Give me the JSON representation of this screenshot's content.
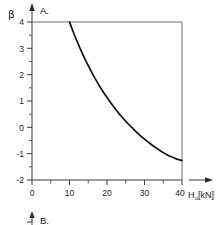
{
  "figure": {
    "panel_a_label": "A.",
    "panel_b_label": "B.",
    "y_axis_symbol": "β",
    "x_axis_title": "H",
    "x_axis_subscript": "o",
    "x_axis_unit": "[kN]"
  },
  "chart_data": {
    "type": "line",
    "title": "A.",
    "xlabel": "H₀ [kN]",
    "ylabel": "β",
    "xlim": [
      0,
      40
    ],
    "ylim": [
      -2,
      4
    ],
    "grid": false,
    "legend": "none",
    "x_ticks": [
      0,
      10,
      20,
      30,
      40
    ],
    "x_tick_labels": [
      "0",
      "10",
      "20",
      "30",
      "40"
    ],
    "x_minor_ticks": [
      5,
      15,
      25,
      35
    ],
    "y_ticks": [
      -2,
      -1,
      0,
      1,
      2,
      3,
      4
    ],
    "y_tick_labels": [
      "-2",
      "-1",
      "0",
      "1",
      "2",
      "3",
      "4"
    ],
    "y_minor_ticks": [
      -1.5,
      -0.5,
      0.5,
      1.5,
      2.5,
      3.5
    ],
    "series": [
      {
        "name": "beta-vs-H0",
        "x": [
          10,
          11,
          12,
          13,
          14,
          15,
          16,
          17,
          18,
          19,
          20,
          21,
          22,
          23,
          24,
          25,
          26,
          27,
          28,
          29,
          30,
          31,
          32,
          33,
          34,
          35,
          36,
          37,
          38,
          39,
          40
        ],
        "values": [
          4.0,
          3.62,
          3.27,
          2.94,
          2.63,
          2.34,
          2.07,
          1.81,
          1.57,
          1.34,
          1.13,
          0.93,
          0.74,
          0.56,
          0.39,
          0.23,
          0.08,
          -0.06,
          -0.2,
          -0.33,
          -0.45,
          -0.56,
          -0.67,
          -0.77,
          -0.87,
          -0.96,
          -1.04,
          -1.11,
          -1.17,
          -1.22,
          -1.26
        ]
      }
    ],
    "annotations": [
      {
        "text": "A.",
        "role": "panel-label",
        "position": "top-left-outside"
      },
      {
        "text": "B.",
        "role": "panel-label",
        "position": "below-figure-clipped"
      }
    ]
  },
  "colors": {
    "curve": "#111111",
    "axis": "#3a3a3a",
    "frame": "#6e6e6e",
    "background": "#ffffff"
  }
}
